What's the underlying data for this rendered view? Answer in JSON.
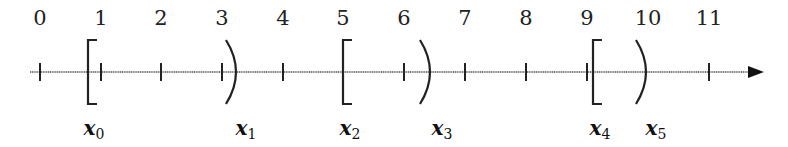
{
  "diagram": {
    "type": "number-line",
    "axis": {
      "min": 0,
      "max": 11,
      "arrow": "right",
      "color": "#333333"
    },
    "tick_labels": [
      "0",
      "1",
      "2",
      "3",
      "4",
      "5",
      "6",
      "7",
      "8",
      "9",
      "10",
      "11"
    ],
    "intervals": [
      {
        "name": "x",
        "sub": "0",
        "left": "[",
        "right": ")"
      },
      {
        "name": "x",
        "sub": "2",
        "left": "[",
        "right": ")"
      },
      {
        "name": "x",
        "sub": "4",
        "left": "[",
        "right": ")"
      }
    ],
    "markers": [
      {
        "symbol": "[",
        "label_name": "x",
        "label_sub": "0"
      },
      {
        "symbol": ")",
        "label_name": "x",
        "label_sub": "1"
      },
      {
        "symbol": "[",
        "label_name": "x",
        "label_sub": "2"
      },
      {
        "symbol": ")",
        "label_name": "x",
        "label_sub": "3"
      },
      {
        "symbol": "[",
        "label_name": "x",
        "label_sub": "4"
      },
      {
        "symbol": ")",
        "label_name": "x",
        "label_sub": "5"
      }
    ]
  }
}
